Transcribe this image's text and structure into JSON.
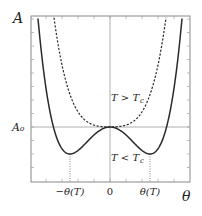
{
  "diagram": {
    "y_axis_label": "A",
    "x_axis_label": "θ",
    "reference_level_label": "A₀",
    "x_tick_labels": {
      "left": "−θ(T)",
      "center": "0",
      "right": "θ(T)"
    },
    "curves": [
      {
        "name": "T > Tc",
        "label_main": "T > T",
        "label_sub": "c",
        "style": "dashed",
        "formula": "A = A0 + 0.3θ² + 0.9θ⁴",
        "coefficients": {
          "quadratic": 0.3,
          "quartic": 0.9
        }
      },
      {
        "name": "T < Tc",
        "label_main": "T < T",
        "label_sub": "c",
        "style": "solid",
        "formula": "A = A0 − 2θ² + θ⁴",
        "coefficients": {
          "quadratic": -2,
          "quartic": 1
        },
        "minima_theta": [
          -1,
          1
        ],
        "minimum_value_rel_A0": -1
      }
    ],
    "theta_range": [
      -2.0,
      2.0
    ],
    "A_range_rel_A0": [
      -1.67,
      4.11
    ],
    "colors": {
      "curve": "#2a2a2a",
      "frame": "#888888",
      "guide": "#9a9a9a"
    }
  }
}
